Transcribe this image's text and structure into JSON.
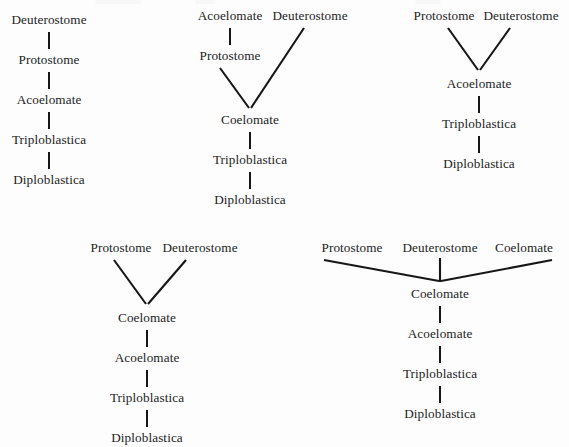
{
  "page": {
    "background_color": "#fdfdfd",
    "text_color": "#1c1c1c",
    "line_color": "#161616"
  },
  "diagrams": [
    {
      "id": "diagram-1",
      "label": "linear-chain-deuterostome-top",
      "nodes": [
        {
          "name": "node-deuterostome",
          "text": "Deuterostome"
        },
        {
          "name": "node-protostome",
          "text": "Protostome"
        },
        {
          "name": "node-acoelomate",
          "text": "Acoelomate"
        },
        {
          "name": "node-triploblastica",
          "text": "Triploblastica"
        },
        {
          "name": "node-diploblastica",
          "text": "Diploblastica"
        }
      ]
    },
    {
      "id": "diagram-2",
      "label": "acoelomate-protostome-branch-with-deuterostome",
      "nodes": [
        {
          "name": "node-acoelomate",
          "text": "Acoelomate"
        },
        {
          "name": "node-deuterostome",
          "text": "Deuterostome"
        },
        {
          "name": "node-protostome",
          "text": "Protostome"
        },
        {
          "name": "node-coelomate",
          "text": "Coelomate"
        },
        {
          "name": "node-triploblastica",
          "text": "Triploblastica"
        },
        {
          "name": "node-diploblastica",
          "text": "Diploblastica"
        }
      ]
    },
    {
      "id": "diagram-3",
      "label": "protostome-deuterostome-converge-to-acoelomate",
      "nodes": [
        {
          "name": "node-protostome",
          "text": "Protostome"
        },
        {
          "name": "node-deuterostome",
          "text": "Deuterostome"
        },
        {
          "name": "node-acoelomate",
          "text": "Acoelomate"
        },
        {
          "name": "node-triploblastica",
          "text": "Triploblastica"
        },
        {
          "name": "node-diploblastica",
          "text": "Diploblastica"
        }
      ]
    },
    {
      "id": "diagram-4",
      "label": "protostome-deuterostome-converge-to-coelomate",
      "nodes": [
        {
          "name": "node-protostome",
          "text": "Protostome"
        },
        {
          "name": "node-deuterostome",
          "text": "Deuterostome"
        },
        {
          "name": "node-coelomate",
          "text": "Coelomate"
        },
        {
          "name": "node-acoelomate",
          "text": "Acoelomate"
        },
        {
          "name": "node-triploblastica",
          "text": "Triploblastica"
        },
        {
          "name": "node-diploblastica",
          "text": "Diploblastica"
        }
      ]
    },
    {
      "id": "diagram-5",
      "label": "three-way-polytomy-to-coelomate",
      "nodes": [
        {
          "name": "node-protostome",
          "text": "Protostome"
        },
        {
          "name": "node-deuterostome",
          "text": "Deuterostome"
        },
        {
          "name": "node-coelomate-top",
          "text": "Coelomate"
        },
        {
          "name": "node-coelomate",
          "text": "Coelomate"
        },
        {
          "name": "node-acoelomate",
          "text": "Acoelomate"
        },
        {
          "name": "node-triploblastica",
          "text": "Triploblastica"
        },
        {
          "name": "node-diploblastica",
          "text": "Diploblastica"
        }
      ]
    }
  ]
}
